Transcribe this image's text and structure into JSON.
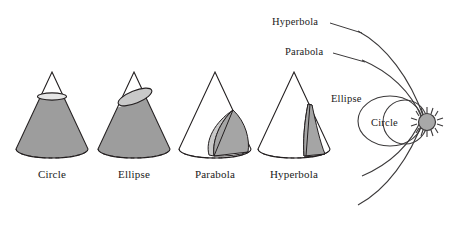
{
  "figure": {
    "background_color": "#ffffff",
    "stroke_color": "#231f20",
    "fill_shade_dark": "#9d9d9d",
    "fill_shade_light": "#c9c9c9",
    "sun_color": "#a8a8a8"
  },
  "cones": {
    "items": [
      {
        "id": "cone-circle",
        "label": "Circle",
        "label_x": 52,
        "cut": "horizontal cross-section near apex",
        "shaded": "lower frustum"
      },
      {
        "id": "cone-ellipse",
        "label": "Ellipse",
        "label_x": 134,
        "cut": "oblique plane cutting both sides of the lateral surface",
        "shaded": "lower portion"
      },
      {
        "id": "cone-parabola",
        "label": "Parabola",
        "label_x": 215,
        "cut": "plane parallel to one slant edge meeting the base",
        "shaded": "slice face"
      },
      {
        "id": "cone-hyperbola",
        "label": "Hyperbola",
        "label_x": 294,
        "cut": "plane parallel to the cone axis meeting the base",
        "shaded": "slice face"
      }
    ]
  },
  "orbits": {
    "focus_label": "sun",
    "labels": [
      {
        "id": "orbit-label-hyperbola",
        "text": "Hyperbola",
        "x": 272,
        "y": 17
      },
      {
        "id": "orbit-label-parabola",
        "text": "Parabola",
        "x": 285,
        "y": 47
      },
      {
        "id": "orbit-label-ellipse",
        "text": "Ellipse",
        "x": 331,
        "y": 94
      },
      {
        "id": "orbit-label-circle",
        "text": "Circle",
        "x": 371,
        "y": 118
      }
    ],
    "leader_lines": [
      {
        "id": "leader-hyperbola",
        "from_x": 330,
        "from_y": 23,
        "to_x": 362,
        "to_y": 33
      },
      {
        "id": "leader-parabola",
        "from_x": 333,
        "from_y": 53,
        "to_x": 365,
        "to_y": 62
      }
    ],
    "paths": [
      {
        "id": "orbit-circle",
        "type": "circle",
        "eccentricity": 0
      },
      {
        "id": "orbit-ellipse",
        "type": "ellipse",
        "eccentricity": 0.55
      },
      {
        "id": "orbit-parabola",
        "type": "parabola",
        "eccentricity": 1
      },
      {
        "id": "orbit-hyperbola",
        "type": "hyperbola",
        "eccentricity": 1.4
      }
    ]
  }
}
